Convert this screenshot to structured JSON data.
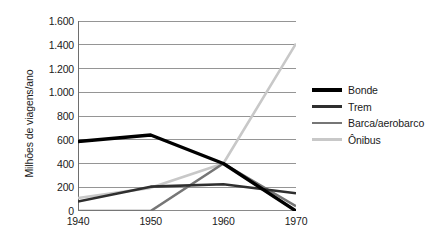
{
  "chart_data": {
    "type": "line",
    "title": "",
    "xlabel": "",
    "ylabel": "Milhões de viagens/ano",
    "x": [
      1940,
      1950,
      1960,
      1970
    ],
    "categories": [
      "1940",
      "1950",
      "1960",
      "1970"
    ],
    "xtick_labels": [
      "1940",
      "1950",
      "1960",
      "1970"
    ],
    "ytick_labels": [
      "0",
      "200",
      "400",
      "600",
      "800",
      "1.000",
      "1.200",
      "1.400",
      "1.600"
    ],
    "ytick_values": [
      0,
      200,
      400,
      600,
      800,
      1000,
      1200,
      1400,
      1600
    ],
    "ylim": [
      0,
      1600
    ],
    "xlim": [
      1940,
      1970
    ],
    "grid": "horizontal",
    "legend_position": "right",
    "background_color": "#ffffff",
    "grid_color": "#8a8a8a",
    "axis_color": "#6e6e6e",
    "series": [
      {
        "name": "Bonde",
        "color": "#000000",
        "width": 3.4,
        "values": [
          585,
          640,
          400,
          0
        ]
      },
      {
        "name": "Trem",
        "color": "#2f2f2f",
        "width": 2.6,
        "values": [
          80,
          205,
          225,
          150
        ]
      },
      {
        "name": "Barca/aerobarco",
        "color": "#767676",
        "width": 2.6,
        "values": [
          0,
          0,
          400,
          40
        ]
      },
      {
        "name": "Ônibus",
        "color": "#c8c8c8",
        "width": 2.6,
        "values": [
          110,
          195,
          400,
          1410
        ]
      }
    ]
  },
  "legend": {
    "items": [
      {
        "label": "Bonde"
      },
      {
        "label": "Trem"
      },
      {
        "label": "Barca/aerobarco"
      },
      {
        "label": "Ônibus"
      }
    ]
  },
  "axes": {
    "y_title": "Milhões de viagens/ano"
  }
}
